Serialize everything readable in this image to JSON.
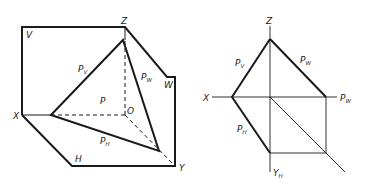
{
  "left_figure": {
    "description": "Axonometric view of plane P intersecting the three projection planes",
    "labels": {
      "Z": "Z",
      "V": "V",
      "Pv": "P",
      "Pv_sub": "V",
      "Pw": "P",
      "Pw_sub": "W",
      "W": "W",
      "P": "P",
      "O": "O",
      "X": "X",
      "Ph": "P",
      "Ph_sub": "H",
      "H": "H",
      "Y": "Y"
    }
  },
  "right_figure": {
    "description": "Orthographic projection showing traces of plane P",
    "labels": {
      "Z": "Z",
      "Pv": "P",
      "Pv_sub": "V",
      "Pw": "P",
      "Pw_sub": "W",
      "X": "X",
      "Pw_axis": "P",
      "Pw_axis_sub": "W",
      "Ph": "P",
      "Ph_sub": "H",
      "Yh": "Y",
      "Yh_sub": "H"
    }
  },
  "colors": {
    "line": "#1a1a1a",
    "background": "#ffffff"
  }
}
